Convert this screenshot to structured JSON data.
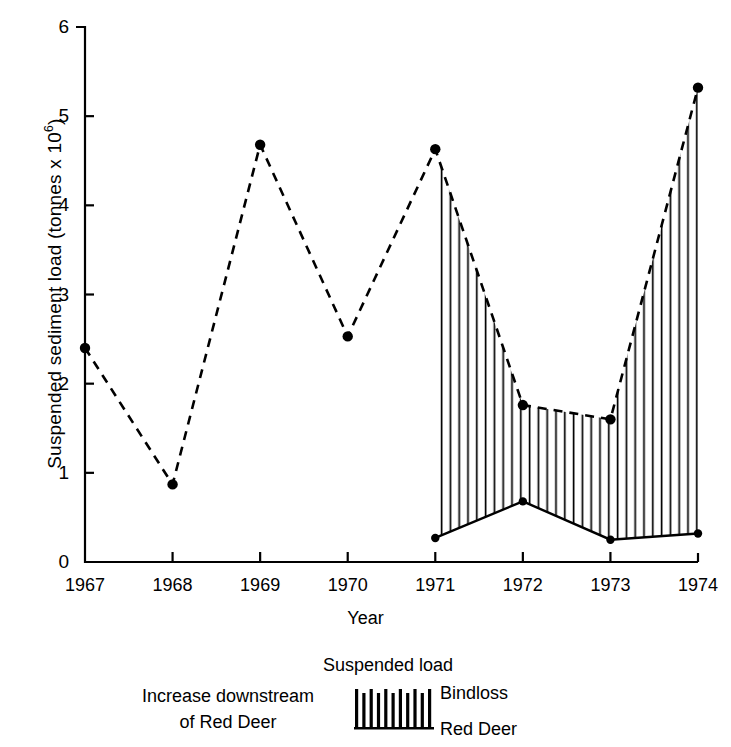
{
  "chart_data": {
    "type": "line",
    "title": "",
    "xlabel": "Year",
    "ylabel": "Suspended sediment load (tonnes x 10⁶)",
    "ylabel_base": "Suspended sediment load (tonnes x 10",
    "ylabel_exponent": "6",
    "ylabel_tail": ")",
    "x": [
      1967,
      1968,
      1969,
      1970,
      1971,
      1972,
      1973,
      1974
    ],
    "xtick_labels": [
      "1967",
      "1968",
      "1969",
      "1970",
      "1971",
      "1972",
      "1973",
      "1974"
    ],
    "ytick_labels": [
      "0",
      "1",
      "2",
      "3",
      "4",
      "5",
      "6"
    ],
    "ytick_values": [
      0,
      1,
      2,
      3,
      4,
      5,
      6
    ],
    "ylim": [
      0,
      6
    ],
    "xlim": [
      1967,
      1974
    ],
    "grid": false,
    "legend_position": "below-plot",
    "series": [
      {
        "name": "Bindloss",
        "style": "dashed",
        "marker": "filled-circle",
        "x": [
          1967,
          1968,
          1969,
          1970,
          1971,
          1972,
          1973,
          1974
        ],
        "values": [
          2.4,
          0.87,
          4.68,
          2.53,
          4.63,
          1.76,
          1.6,
          5.32
        ]
      },
      {
        "name": "Red Deer",
        "style": "solid",
        "marker": "filled-circle",
        "x": [
          1971,
          1972,
          1973,
          1974
        ],
        "values": [
          0.27,
          0.68,
          0.25,
          0.32
        ]
      }
    ],
    "fill": {
      "name": "Increase downstream of Red Deer",
      "pattern": "vertical-hatch",
      "between": [
        "Red Deer",
        "Bindloss"
      ],
      "x_range": [
        1971,
        1974
      ]
    }
  },
  "legend": {
    "title": "Suspended load",
    "left_line1": "Increase downstream",
    "left_line2": "of Red Deer",
    "bindloss_label": "Bindloss",
    "reddeer_label": "Red Deer",
    "swatch_name": "vertical-hatch-swatch"
  },
  "axis": {
    "x_title": "Year"
  },
  "colors": {
    "ink": "#000000",
    "background": "#ffffff"
  }
}
